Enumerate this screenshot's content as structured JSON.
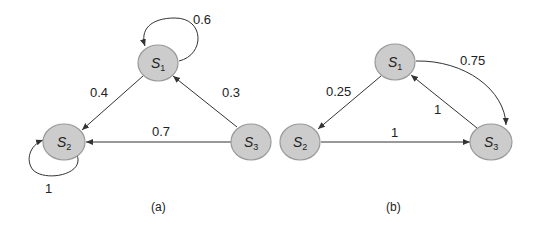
{
  "figure": {
    "panels": [
      {
        "caption": "(a)",
        "nodes": [
          {
            "id": "S1",
            "base": "S",
            "sub": "1"
          },
          {
            "id": "S2",
            "base": "S",
            "sub": "2"
          },
          {
            "id": "S3",
            "base": "S",
            "sub": "3"
          }
        ],
        "edges": [
          {
            "from": "S1",
            "to": "S1",
            "label": "0.6"
          },
          {
            "from": "S1",
            "to": "S2",
            "label": "0.4"
          },
          {
            "from": "S3",
            "to": "S1",
            "label": "0.3"
          },
          {
            "from": "S3",
            "to": "S2",
            "label": "0.7"
          },
          {
            "from": "S2",
            "to": "S2",
            "label": "1"
          }
        ]
      },
      {
        "caption": "(b)",
        "nodes": [
          {
            "id": "S1",
            "base": "S",
            "sub": "1"
          },
          {
            "id": "S2",
            "base": "S",
            "sub": "2"
          },
          {
            "id": "S3",
            "base": "S",
            "sub": "3"
          }
        ],
        "edges": [
          {
            "from": "S1",
            "to": "S3",
            "label": "0.75"
          },
          {
            "from": "S1",
            "to": "S2",
            "label": "0.25"
          },
          {
            "from": "S3",
            "to": "S1",
            "label": "1"
          },
          {
            "from": "S2",
            "to": "S3",
            "label": "1"
          }
        ]
      }
    ]
  },
  "colors": {
    "node_fill": "#cccccc",
    "node_stroke": "#999999",
    "edge": "#333333"
  }
}
